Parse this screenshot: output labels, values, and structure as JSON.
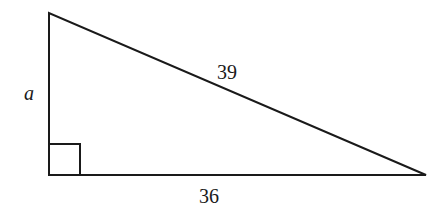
{
  "diagram": {
    "type": "right-triangle",
    "labels": {
      "vertical_leg": "a",
      "hypotenuse": "39",
      "horizontal_leg": "36"
    },
    "right_angle_marker": true,
    "vertices": {
      "top": [
        49,
        13
      ],
      "bottom_left": [
        49,
        175
      ],
      "bottom_right": [
        426,
        175
      ]
    },
    "stroke_color": "#1a1a1a"
  }
}
